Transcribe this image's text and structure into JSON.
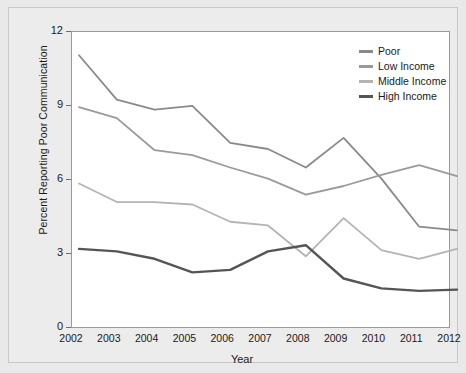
{
  "chart_data": {
    "type": "line",
    "title": "",
    "xlabel": "Year",
    "ylabel": "Percent Reporting Poor Communication",
    "categories": [
      2002,
      2003,
      2004,
      2005,
      2006,
      2007,
      2008,
      2009,
      2010,
      2011,
      2012
    ],
    "x": [
      "2002",
      "2003",
      "2004",
      "2005",
      "2006",
      "2007",
      "2008",
      "2009",
      "2010",
      "2011",
      "2012"
    ],
    "xlim": [
      2002,
      2012
    ],
    "ylim": [
      0,
      12
    ],
    "yticks": [
      "0",
      "3",
      "6",
      "9",
      "12"
    ],
    "ytick_values": [
      0,
      3,
      6,
      9,
      12
    ],
    "grid": false,
    "legend_position": "top-right",
    "series": [
      {
        "name": "Poor",
        "color": "#8a8a8a",
        "width": 1.8,
        "values": [
          11.3,
          9.5,
          9.1,
          9.25,
          7.75,
          7.5,
          6.75,
          7.95,
          6.3,
          4.35,
          4.2
        ]
      },
      {
        "name": "Low Income",
        "color": "#9a9a9a",
        "width": 1.8,
        "values": [
          9.2,
          8.75,
          7.45,
          7.25,
          6.75,
          6.3,
          5.65,
          6.0,
          6.45,
          6.85,
          6.4
        ]
      },
      {
        "name": "Middle Income",
        "color": "#b4b4b4",
        "width": 1.8,
        "values": [
          6.1,
          5.35,
          5.35,
          5.25,
          4.55,
          4.4,
          3.15,
          4.7,
          3.4,
          3.05,
          3.45
        ]
      },
      {
        "name": "High Income",
        "color": "#555555",
        "width": 2.4,
        "values": [
          3.45,
          3.35,
          3.05,
          2.5,
          2.6,
          3.35,
          3.6,
          2.25,
          1.85,
          1.75,
          1.8
        ]
      }
    ]
  },
  "legend": {
    "items": [
      {
        "label": "Poor",
        "color": "#8a8a8a"
      },
      {
        "label": "Low Income",
        "color": "#9a9a9a"
      },
      {
        "label": "Middle Income",
        "color": "#b4b4b4"
      },
      {
        "label": "High Income",
        "color": "#555555"
      }
    ]
  },
  "axes": {
    "y_title": "Percent Reporting Poor Communication",
    "x_title": "Year",
    "y_ticks": [
      "12",
      "9",
      "6",
      "3",
      "0"
    ],
    "x_ticks": [
      "2002",
      "2003",
      "2004",
      "2005",
      "2006",
      "2007",
      "2008",
      "2009",
      "2010",
      "2011",
      "2012"
    ]
  }
}
